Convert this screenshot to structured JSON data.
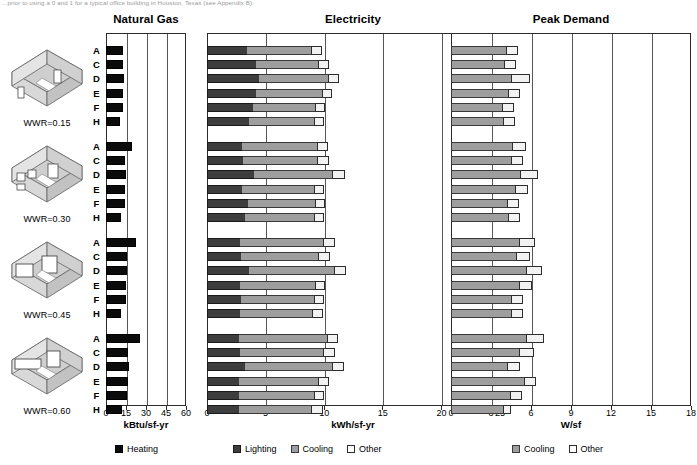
{
  "caption": "...prior to using a 0 and 1 for a typical office building in Houston, Texas (see Appendix B).",
  "panels": [
    {
      "id": "natural-gas",
      "title": "Natural Gas",
      "axis_label": "kBtu/sf-yr",
      "ticks": [
        0,
        15,
        30,
        45,
        60
      ],
      "max": 60,
      "legend": [
        {
          "key": "heating",
          "label": "Heating",
          "color": "#0b0b0b"
        }
      ]
    },
    {
      "id": "electricity",
      "title": "Electricity",
      "axis_label": "kWh/sf-yr",
      "ticks": [
        0,
        5,
        10,
        15,
        20,
        25
      ],
      "max": 25,
      "legend": [
        {
          "key": "lighting",
          "label": "Lighting",
          "color": "#3d3d3d"
        },
        {
          "key": "cooling",
          "label": "Cooling",
          "color": "#9e9e9e"
        },
        {
          "key": "other",
          "label": "Other",
          "color": "#ffffff"
        }
      ]
    },
    {
      "id": "peak-demand",
      "title": "Peak Demand",
      "axis_label": "W/sf",
      "ticks": [
        0,
        3,
        6,
        9,
        12,
        15,
        18
      ],
      "max": 18,
      "legend": [
        {
          "key": "cooling",
          "label": "Cooling",
          "color": "#9e9e9e"
        },
        {
          "key": "other",
          "label": "Other",
          "color": "#ffffff"
        }
      ]
    }
  ],
  "groups": [
    {
      "id": "wwr-015",
      "label": "WWR=0.15",
      "windows": "few-small"
    },
    {
      "id": "wwr-030",
      "label": "WWR=0.30",
      "windows": "several-small"
    },
    {
      "id": "wwr-045",
      "label": "WWR=0.45",
      "windows": "two-large"
    },
    {
      "id": "wwr-060",
      "label": "WWR=0.60",
      "windows": "ribbon"
    }
  ],
  "row_labels": [
    "A",
    "C",
    "D",
    "E",
    "F",
    "H"
  ],
  "chart_data": {
    "type": "bar",
    "orientation": "horizontal",
    "grid": true,
    "legend_position": "bottom",
    "group_variable": "WWR",
    "groups": [
      "WWR=0.15",
      "WWR=0.30",
      "WWR=0.45",
      "WWR=0.60"
    ],
    "categories": [
      "A",
      "C",
      "D",
      "E",
      "F",
      "H"
    ],
    "panels": [
      {
        "name": "Natural Gas",
        "xlabel": "kBtu/sf-yr",
        "xlim": [
          0,
          60
        ],
        "xticks": [
          0,
          15,
          30,
          45,
          60
        ],
        "series": [
          {
            "name": "Heating",
            "color": "#0b0b0b"
          }
        ],
        "values": {
          "WWR=0.15": {
            "Heating": [
              12.8,
              12.4,
              13.4,
              13.0,
              12.6,
              10.2
            ]
          },
          "WWR=0.30": {
            "Heating": [
              19.6,
              14.2,
              15.0,
              14.6,
              14.0,
              11.0
            ]
          },
          "WWR=0.45": {
            "Heating": [
              22.6,
              15.4,
              16.0,
              15.2,
              14.8,
              11.6
            ]
          },
          "WWR=0.60": {
            "Heating": [
              25.8,
              16.6,
              17.0,
              16.2,
              15.6,
              12.2
            ]
          }
        }
      },
      {
        "name": "Electricity",
        "xlabel": "kWh/sf-yr",
        "xlim": [
          0,
          25
        ],
        "xticks": [
          0,
          5,
          10,
          15,
          20,
          25
        ],
        "series": [
          {
            "name": "Lighting",
            "color": "#3d3d3d"
          },
          {
            "name": "Cooling",
            "color": "#9e9e9e"
          },
          {
            "name": "Other",
            "color": "#ffffff"
          }
        ],
        "values": {
          "WWR=0.15": {
            "Lighting": [
              3.4,
              4.2,
              4.4,
              4.2,
              3.9,
              3.6
            ],
            "Cooling": [
              5.5,
              5.3,
              5.9,
              5.6,
              5.3,
              5.5
            ],
            "Other": [
              0.9,
              0.9,
              1.0,
              0.9,
              0.9,
              0.9
            ]
          },
          "WWR=0.30": {
            "Lighting": [
              3.0,
              3.1,
              4.0,
              3.0,
              3.5,
              3.2
            ],
            "Cooling": [
              6.4,
              6.3,
              6.7,
              6.1,
              5.7,
              5.9
            ],
            "Other": [
              0.9,
              1.0,
              1.1,
              0.9,
              0.9,
              0.9
            ]
          },
          "WWR=0.45": {
            "Lighting": [
              2.8,
              2.9,
              3.6,
              2.8,
              2.9,
              2.8
            ],
            "Cooling": [
              7.1,
              6.6,
              7.2,
              6.4,
              6.2,
              6.2
            ],
            "Other": [
              1.0,
              1.0,
              1.1,
              0.9,
              0.9,
              0.9
            ]
          },
          "WWR=0.60": {
            "Lighting": [
              2.7,
              2.8,
              3.2,
              2.7,
              2.7,
              2.7
            ],
            "Cooling": [
              7.5,
              7.1,
              7.5,
              6.8,
              6.4,
              6.2
            ],
            "Other": [
              1.0,
              1.0,
              1.0,
              0.9,
              0.9,
              1.0
            ]
          }
        }
      },
      {
        "name": "Peak Demand",
        "xlabel": "W/sf",
        "xlim": [
          0,
          18
        ],
        "xticks": [
          0,
          3,
          6,
          9,
          12,
          15,
          18
        ],
        "series": [
          {
            "name": "Cooling",
            "color": "#9e9e9e"
          },
          {
            "name": "Other",
            "color": "#ffffff"
          }
        ],
        "values": {
          "WWR=0.15": {
            "Cooling": [
              4.1,
              4.0,
              4.5,
              4.3,
              3.8,
              3.9
            ],
            "Other": [
              0.9,
              0.9,
              1.4,
              0.9,
              0.9,
              0.9
            ]
          },
          "WWR=0.30": {
            "Cooling": [
              4.6,
              4.5,
              5.2,
              4.8,
              4.2,
              4.3
            ],
            "Other": [
              1.0,
              0.9,
              1.3,
              1.0,
              0.9,
              0.9
            ]
          },
          "WWR=0.45": {
            "Cooling": [
              5.1,
              4.9,
              5.6,
              5.1,
              4.5,
              4.5
            ],
            "Other": [
              1.2,
              1.0,
              1.2,
              1.0,
              0.9,
              0.9
            ]
          },
          "WWR=0.60": {
            "Cooling": [
              5.6,
              5.1,
              4.2,
              5.5,
              4.4,
              3.9
            ],
            "Other": [
              1.4,
              1.1,
              1.0,
              0.9,
              0.9,
              0.6
            ]
          }
        }
      }
    ]
  }
}
